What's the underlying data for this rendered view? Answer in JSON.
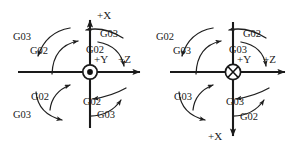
{
  "figure": {
    "background_color": "#ffffff",
    "line_color": "#1a1a1a",
    "width": 295,
    "height": 148
  },
  "diagrams": [
    {
      "id": "left",
      "name": "y-axis-out-of-page",
      "center": {
        "x": 90,
        "y": 72
      },
      "center_symbol": "dot-in-circle",
      "center_symbol_meaning": "axis-toward-viewer",
      "axes": [
        {
          "name": "x-axis",
          "label": "+X",
          "sign": "+",
          "letter": "X",
          "direction": "up"
        },
        {
          "name": "z-axis",
          "label": "+Z",
          "sign": "+",
          "letter": "Z",
          "direction": "right"
        },
        {
          "name": "y-axis",
          "label": "+Y",
          "sign": "+",
          "letter": "Y",
          "direction": "out-of-page"
        }
      ],
      "quadrants": [
        {
          "name": "upper-left",
          "inner_label": "G02",
          "outer_label": "G03"
        },
        {
          "name": "upper-right",
          "inner_label": "G02",
          "outer_label": "G03"
        },
        {
          "name": "lower-left",
          "inner_label": "G02",
          "outer_label": "G03"
        },
        {
          "name": "lower-right",
          "inner_label": "G02",
          "outer_label": "G03"
        }
      ]
    },
    {
      "id": "right",
      "name": "y-axis-into-page",
      "center": {
        "x": 233,
        "y": 72
      },
      "center_symbol": "cross-in-circle",
      "center_symbol_meaning": "axis-away-from-viewer",
      "axes": [
        {
          "name": "x-axis",
          "label": "+X",
          "sign": "+",
          "letter": "X",
          "direction": "down"
        },
        {
          "name": "z-axis",
          "label": "+Z",
          "sign": "+",
          "letter": "Z",
          "direction": "right"
        },
        {
          "name": "y-axis",
          "label": "+Y",
          "sign": "+",
          "letter": "Y",
          "direction": "into-page"
        }
      ],
      "quadrants": [
        {
          "name": "upper-left",
          "inner_label": "G03",
          "outer_label": "G02"
        },
        {
          "name": "upper-right",
          "inner_label": "G03",
          "outer_label": "G02"
        },
        {
          "name": "lower-left",
          "inner_label": "G03",
          "outer_label": "G02"
        },
        {
          "name": "lower-right",
          "inner_label": "G03",
          "outer_label": "G02"
        }
      ]
    }
  ],
  "labels": {
    "l_ul_outer": "G03",
    "l_ul_inner": "G02",
    "l_ur_outer": "G03",
    "l_ur_inner": "G02",
    "l_ll_inner": "G02",
    "l_ll_outer": "G03",
    "l_lr_inner": "G02",
    "l_lr_outer": "G03",
    "l_axis_top": "+X",
    "l_axis_right": "+Z",
    "l_axis_center": "+Y",
    "r_ul_outer": "G02",
    "r_ul_inner": "G03",
    "r_ur_outer": "G02",
    "r_ur_inner": "G03",
    "r_ll_inner": "G03",
    "r_lr_inner": "G03",
    "r_lr_outer": "G02",
    "r_axis_bottom": "+X",
    "r_axis_right": "+Z",
    "r_axis_center": "+Y"
  }
}
